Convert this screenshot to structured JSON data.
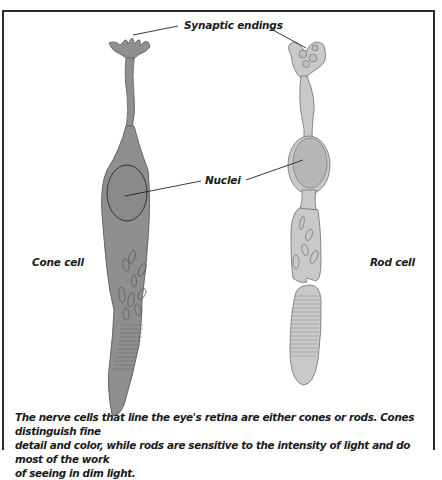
{
  "figure": {
    "labels": {
      "synaptic_endings": "Synaptic endings",
      "nuclei": "Nuclei",
      "cone_cell": "Cone cell",
      "rod_cell": "Rod cell"
    },
    "caption": {
      "line1": "The nerve cells that line the eye's retina are either cones or rods. Cones distinguish fine",
      "line2": "detail and color, while rods are sensitive to the intensity of light and do most of the work",
      "line3": "of seeing in dim light."
    },
    "colors": {
      "cone_fill": "#8f8f8f",
      "cone_outline": "#5a5a5a",
      "rod_fill": "#c9c9c9",
      "rod_outline": "#6e6e6e",
      "frame": "#2a2a2a",
      "text": "#1a1a1a"
    }
  }
}
